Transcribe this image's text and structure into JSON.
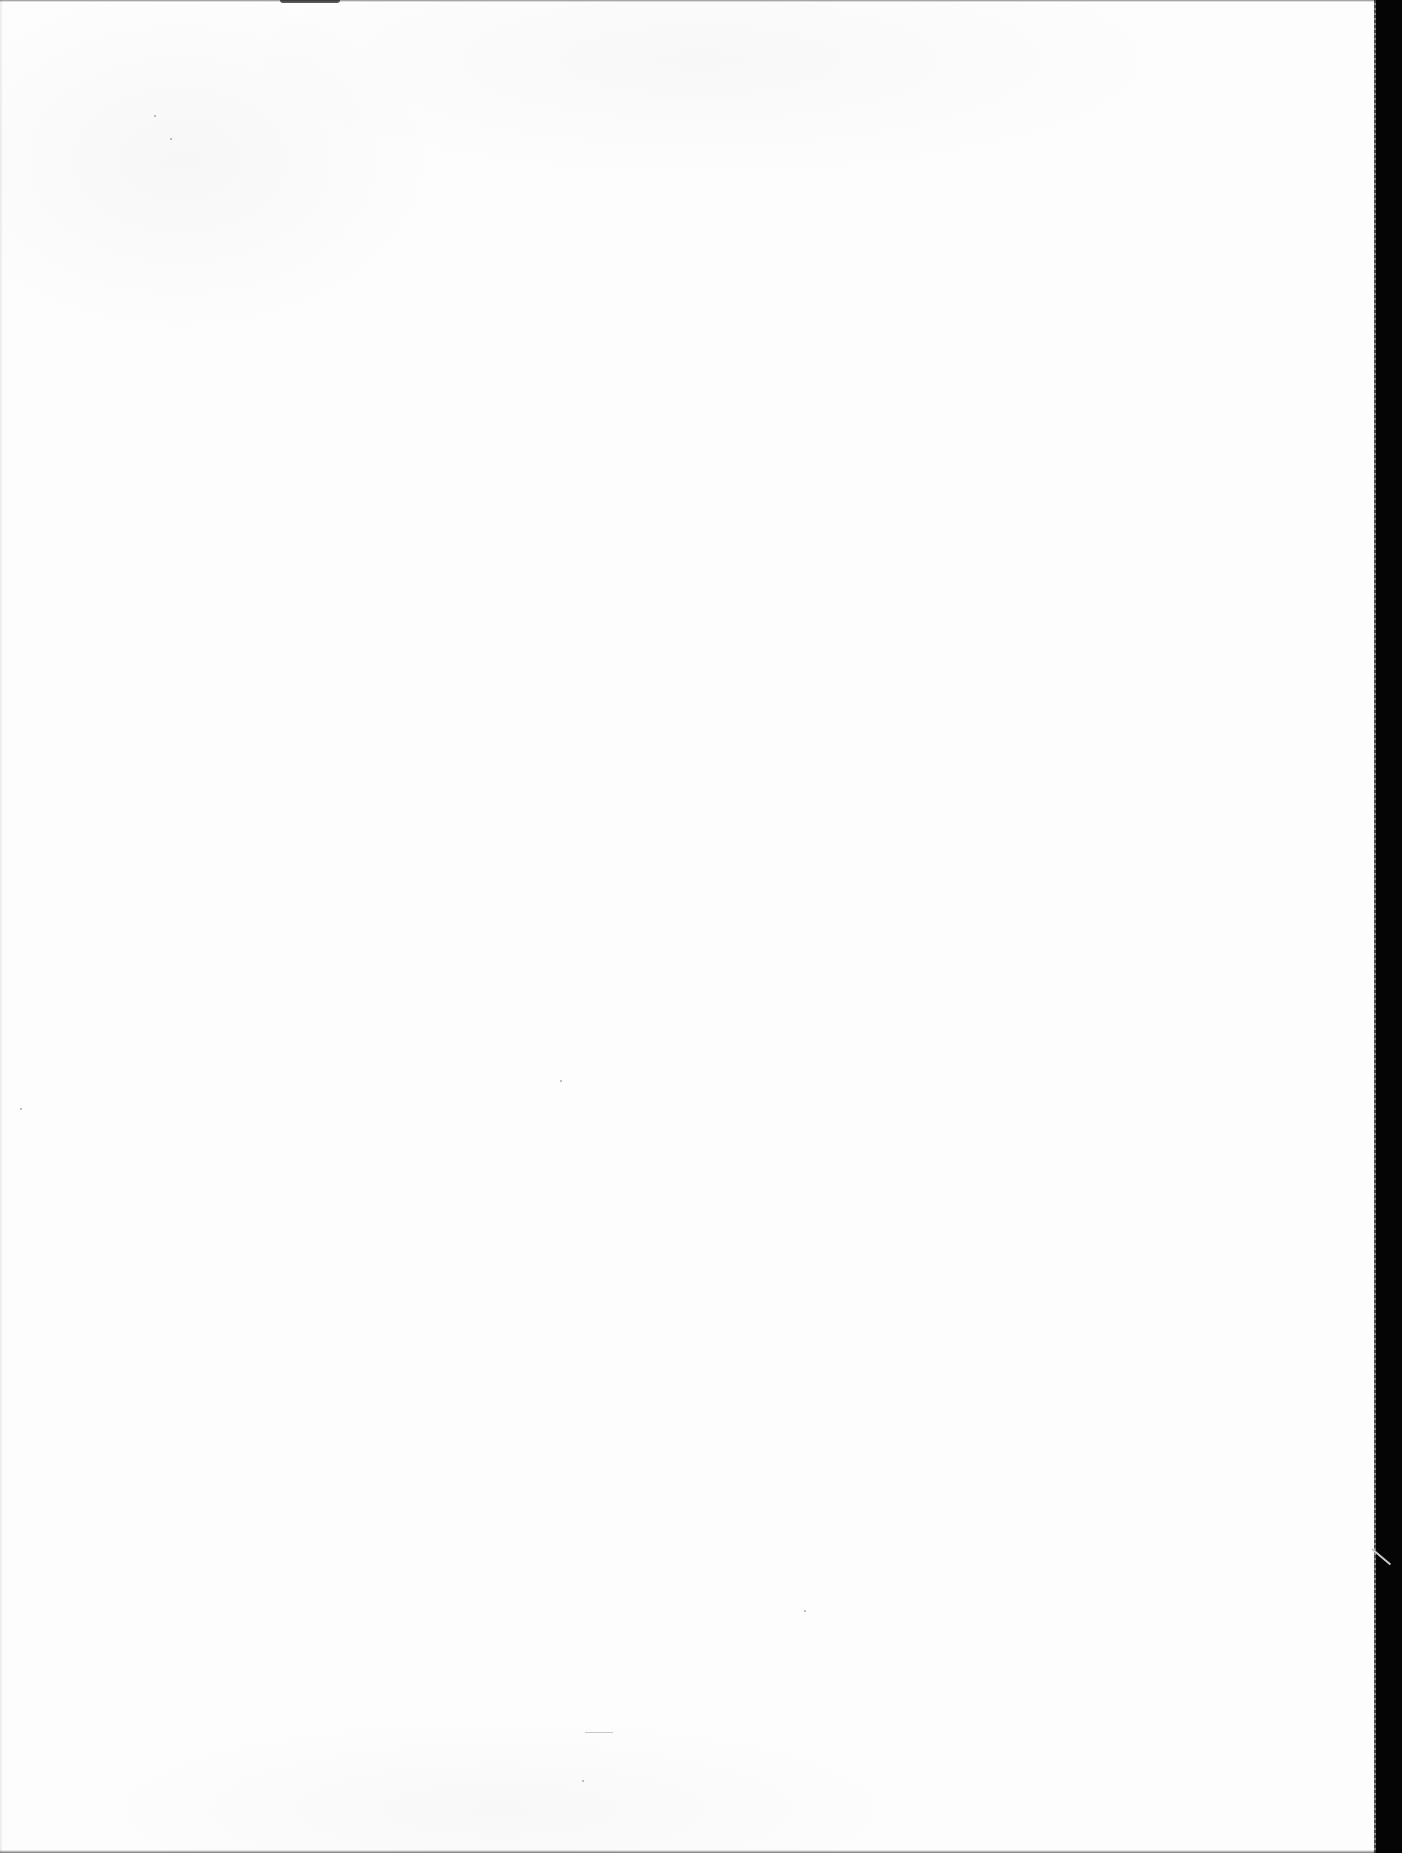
{
  "document": {
    "page_type": "blank",
    "visible_text": [],
    "colors": {
      "page_background": "#fdfdfd",
      "scanner_bed": "#050505"
    }
  }
}
